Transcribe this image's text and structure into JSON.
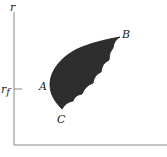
{
  "diagram": {
    "y_axis_label": "r",
    "y_tick_label": "r",
    "y_tick_subscript": "f",
    "points": [
      {
        "label": "A",
        "x": 43,
        "y": 91
      },
      {
        "label": "B",
        "x": 123,
        "y": 37
      },
      {
        "label": "C",
        "x": 58,
        "y": 123
      }
    ],
    "region": {
      "fill": "#2e2e2e",
      "description": "feasible set with scalloped right edge"
    },
    "colors": {
      "axis": "#888888",
      "region": "#2e2e2e",
      "text": "#222222"
    }
  }
}
